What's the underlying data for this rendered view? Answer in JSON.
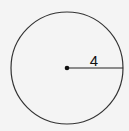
{
  "diagram": {
    "shape": "circle",
    "radius_label": "4",
    "colors": {
      "stroke": "#333333",
      "background": "#f4f4f4",
      "text": "#111111"
    }
  }
}
